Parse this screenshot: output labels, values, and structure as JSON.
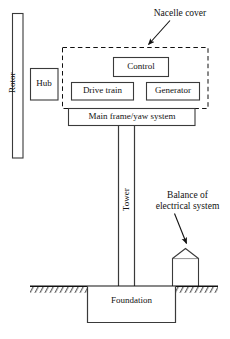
{
  "figure": {
    "kind": "wind-turbine-system-block-diagram",
    "background_color": "#ffffff",
    "line_color": "#1a1a1a",
    "width": 230,
    "height": 339
  },
  "components": {
    "rotor": {
      "label": "Rotor",
      "orientation": "vertical",
      "shape": "tall-rectangle"
    },
    "hub": {
      "label": "Hub",
      "shape": "rectangle"
    },
    "control": {
      "label": "Control",
      "shape": "rectangle"
    },
    "drive_train": {
      "label": "Drive train",
      "shape": "rectangle"
    },
    "generator": {
      "label": "Generator",
      "shape": "rectangle"
    },
    "main_frame": {
      "label": "Main frame/yaw system",
      "shape": "rectangle"
    },
    "tower": {
      "label": "Tower",
      "orientation": "vertical",
      "shape": "two-vertical-lines"
    },
    "foundation": {
      "label": "Foundation",
      "shape": "rectangle-below-ground"
    },
    "balance_of_electrical_system": {
      "label": "Balance of\nelectrical system",
      "line1": "Balance of",
      "line2": "electrical system",
      "shape": "house-with-peaked-roof"
    },
    "nacelle_cover": {
      "label": "Nacelle cover",
      "shape": "dashed-rectangle",
      "contains": [
        "Control",
        "Drive train",
        "Generator"
      ]
    },
    "ground": {
      "label": "",
      "shape": "hatched-ground-line"
    }
  },
  "annotations": [
    {
      "name": "nacelle-cover-callout",
      "text": "Nacelle cover",
      "points_to": "nacelle-cover-dashed-box"
    },
    {
      "name": "balance-callout",
      "text_line_1": "Balance of",
      "text_line_2": "electrical system",
      "points_to": "balance-of-electrical-system-shed"
    }
  ],
  "caption_stub": {
    "text": ""
  }
}
